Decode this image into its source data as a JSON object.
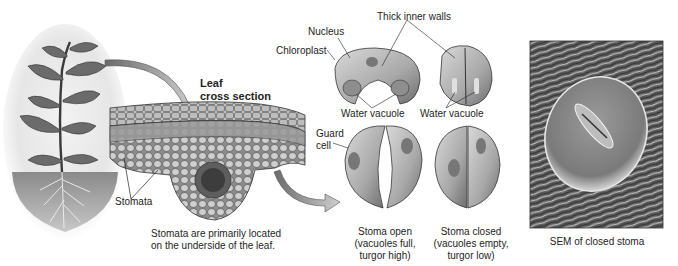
{
  "figure": {
    "panels": {
      "plant": {
        "title": ""
      },
      "leaf_section": {
        "title_line1": "Leaf",
        "title_line2": "cross section",
        "stomata_label": "Stomata",
        "caption_line1": "Stomata are primarily located",
        "caption_line2": "on the underside of the leaf."
      },
      "guard_cells": {
        "nucleus_label": "Nucleus",
        "chloroplast_label": "Chloroplast",
        "thick_walls_label": "Thick inner walls",
        "water_vacuole_open_label": "Water vacuole",
        "water_vacuole_closed_label": "Water vacuole",
        "guard_cell_label_line1": "Guard",
        "guard_cell_label_line2": "cell",
        "open_caption_line1": "Stoma open",
        "open_caption_line2": "(vacuoles full,",
        "open_caption_line3": "turgor high)",
        "closed_caption_line1": "Stoma closed",
        "closed_caption_line2": "(vacuoles empty,",
        "closed_caption_line3": "turgor low)"
      },
      "sem": {
        "caption": "SEM of closed stoma"
      }
    }
  }
}
